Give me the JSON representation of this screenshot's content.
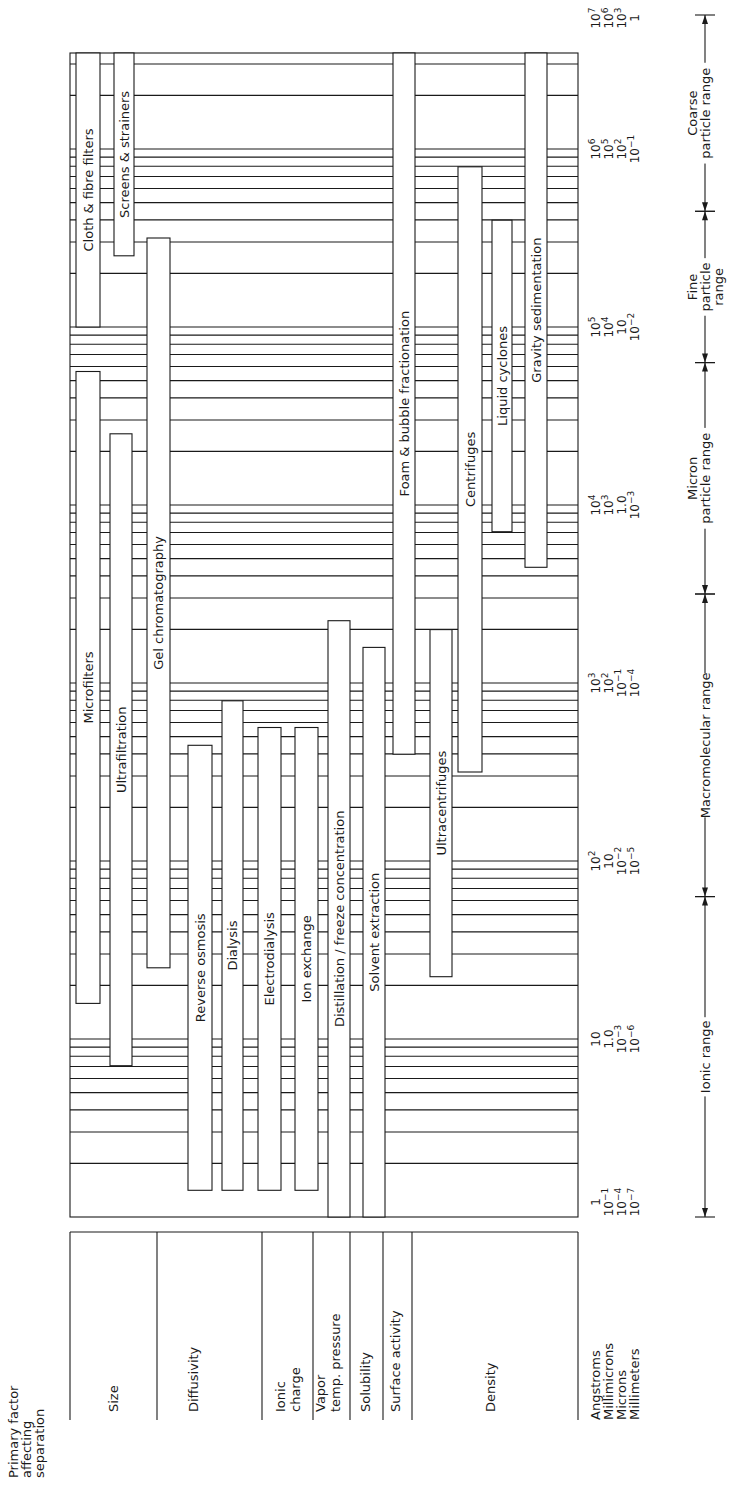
{
  "chart_data": {
    "type": "bar",
    "orientation": "horizontal-range (figure rotated 90 degrees counter-clockwise)",
    "xlabel": "Particle size",
    "scale": "log10 Angstroms",
    "xlim_angstrom": [
      1,
      10000000
    ],
    "units": [
      {
        "name": "Angstroms",
        "ticks": [
          "1",
          "10",
          "10^2",
          "10^3",
          "10^4",
          "10^5",
          "10^6",
          "10^7"
        ]
      },
      {
        "name": "Millimicrons",
        "ticks": [
          "10^-1",
          "1.0",
          "10",
          "10^2",
          "10^3",
          "10^4",
          "10^5",
          "10^6"
        ]
      },
      {
        "name": "Microns",
        "ticks": [
          "10^-4",
          "10^-3",
          "10^-2",
          "10^-1",
          "1.0",
          "10",
          "10^2",
          "10^3"
        ]
      },
      {
        "name": "Millimeters",
        "ticks": [
          "10^-7",
          "10^-6",
          "10^-5",
          "10^-4",
          "10^-3",
          "10^-2",
          "10^-1",
          "1"
        ]
      }
    ],
    "ranges": [
      {
        "label": "Ionic range",
        "from_log": 0,
        "to_log": 1.8
      },
      {
        "label": "Macromolecular range",
        "from_log": 1.8,
        "to_log": 3.5
      },
      {
        "label": "Micron particle range",
        "from_log": 3.5,
        "to_log": 4.8
      },
      {
        "label": "Fine particle range",
        "from_log": 4.8,
        "to_log": 5.65
      },
      {
        "label": "Coarse particle range",
        "from_log": 5.65,
        "to_log": 6.75
      }
    ],
    "factors": [
      {
        "label": "Size",
        "processes": [
          {
            "name": "Cloth & fibre filters",
            "from_log": 5.0,
            "to_log": 6.75
          },
          {
            "name": "Screens & strainers",
            "from_log": 5.4,
            "to_log": 6.75
          },
          {
            "name": "Microfilters",
            "from_log": 1.2,
            "to_log": 4.75
          },
          {
            "name": "Ultrafiltration",
            "from_log": 0.85,
            "to_log": 4.4
          },
          {
            "name": "Gel chromatography",
            "from_log": 1.4,
            "to_log": 5.5
          }
        ]
      },
      {
        "label": "Diffusivity",
        "processes": [
          {
            "name": "Reverse osmosis",
            "from_log": 0.15,
            "to_log": 2.65
          },
          {
            "name": "Dialysis",
            "from_log": 0.15,
            "to_log": 2.9
          },
          {
            "name": "Electrodialysis",
            "from_log": 0.15,
            "to_log": 2.75
          }
        ]
      },
      {
        "label": "Ionic charge",
        "processes": [
          {
            "name": "Ion exchange",
            "from_log": 0.15,
            "to_log": 2.75
          }
        ]
      },
      {
        "label": "Vapor temp. pressure",
        "processes": [
          {
            "name": "Distillation / freeze concentration",
            "from_log": 0.0,
            "to_log": 3.35
          }
        ]
      },
      {
        "label": "Solubility",
        "processes": [
          {
            "name": "Solvent extraction",
            "from_log": 0.0,
            "to_log": 3.2
          }
        ]
      },
      {
        "label": "Surface activity",
        "processes": [
          {
            "name": "Foam & bubble fractionation",
            "from_log": 2.6,
            "to_log": 6.75
          }
        ]
      },
      {
        "label": "Density",
        "processes": [
          {
            "name": "Ultracentrifuges",
            "from_log": 1.35,
            "to_log": 3.3
          },
          {
            "name": "Centrifuges",
            "from_log": 2.5,
            "to_log": 5.9
          },
          {
            "name": "Liquid cyclones",
            "from_log": 3.85,
            "to_log": 5.6
          },
          {
            "name": "Gravity sedimentation",
            "from_log": 3.65,
            "to_log": 6.75
          }
        ]
      }
    ]
  }
}
